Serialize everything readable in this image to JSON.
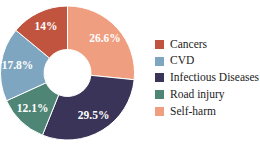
{
  "chart_data": {
    "type": "pie",
    "variant": "donut",
    "title": "",
    "subtitle": "",
    "xlabel": "",
    "ylabel": "",
    "grid": false,
    "legend_position": "right",
    "start_angle_oclock": 12,
    "direction": "clockwise",
    "inner_radius_ratio": 0.34,
    "categories": [
      "Cancers",
      "CVD",
      "Infectious Diseases",
      "Road injury",
      "Self-harm"
    ],
    "values": [
      14.0,
      17.8,
      29.5,
      12.1,
      26.6
    ],
    "value_unit": "%",
    "colors": [
      "#c0543f",
      "#7fa6c0",
      "#3a3558",
      "#4e8574",
      "#ef9e80"
    ],
    "slices": [
      {
        "label": "Self-harm",
        "value": 26.6,
        "display": "26.6%",
        "color": "#ef9e80",
        "label_color": "#ffffff"
      },
      {
        "label": "Infectious Diseases",
        "value": 29.5,
        "display": "29.5%",
        "color": "#3a3558",
        "label_color": "#ffffff"
      },
      {
        "label": "Road injury",
        "value": 12.1,
        "display": "12.1%",
        "color": "#4e8574",
        "label_color": "#ffffff"
      },
      {
        "label": "CVD",
        "value": 17.8,
        "display": "17.8%",
        "color": "#7fa6c0",
        "label_color": "#ffffff"
      },
      {
        "label": "Cancers",
        "value": 14.0,
        "display": "14%",
        "color": "#c0543f",
        "label_color": "#ffffff"
      }
    ]
  },
  "legend": {
    "items": [
      {
        "label": "Cancers",
        "color": "#c0543f"
      },
      {
        "label": "CVD",
        "color": "#7fa6c0"
      },
      {
        "label": "Infectious Diseases",
        "color": "#3a3558"
      },
      {
        "label": "Road injury",
        "color": "#4e8574"
      },
      {
        "label": "Self-harm",
        "color": "#ef9e80"
      }
    ]
  }
}
